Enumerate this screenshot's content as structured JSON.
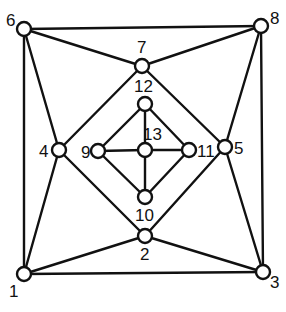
{
  "diagram": {
    "type": "graph",
    "node_radius": 7,
    "colors": {
      "stroke": "#111111",
      "node_fill": "#ffffff",
      "background": "#ffffff"
    },
    "nodes": [
      {
        "id": "1",
        "label": "1",
        "x": 24,
        "y": 274,
        "lx": 9,
        "ly": 297
      },
      {
        "id": "2",
        "label": "2",
        "x": 145,
        "y": 236,
        "lx": 140,
        "ly": 260
      },
      {
        "id": "3",
        "label": "3",
        "x": 263,
        "y": 272,
        "lx": 270,
        "ly": 288
      },
      {
        "id": "4",
        "label": "4",
        "x": 59,
        "y": 150,
        "lx": 39,
        "ly": 157
      },
      {
        "id": "5",
        "label": "5",
        "x": 225,
        "y": 147,
        "lx": 234,
        "ly": 154
      },
      {
        "id": "6",
        "label": "6",
        "x": 24,
        "y": 29,
        "lx": 6,
        "ly": 26
      },
      {
        "id": "7",
        "label": "7",
        "x": 142,
        "y": 66,
        "lx": 137,
        "ly": 53
      },
      {
        "id": "8",
        "label": "8",
        "x": 261,
        "y": 26,
        "lx": 270,
        "ly": 24
      },
      {
        "id": "9",
        "label": "9",
        "x": 98,
        "y": 151,
        "lx": 81,
        "ly": 158
      },
      {
        "id": "10",
        "label": "10",
        "x": 145,
        "y": 197,
        "lx": 135,
        "ly": 221
      },
      {
        "id": "11",
        "label": "11",
        "x": 189,
        "y": 150,
        "lx": 197,
        "ly": 157
      },
      {
        "id": "12",
        "label": "12",
        "x": 145,
        "y": 104,
        "lx": 134,
        "ly": 92
      },
      {
        "id": "13",
        "label": "13",
        "x": 145,
        "y": 150,
        "lx": 143,
        "ly": 140
      }
    ],
    "edges": [
      [
        "6",
        "8"
      ],
      [
        "8",
        "3"
      ],
      [
        "3",
        "1"
      ],
      [
        "1",
        "6"
      ],
      [
        "6",
        "7"
      ],
      [
        "6",
        "4"
      ],
      [
        "8",
        "7"
      ],
      [
        "8",
        "5"
      ],
      [
        "1",
        "4"
      ],
      [
        "1",
        "2"
      ],
      [
        "3",
        "2"
      ],
      [
        "3",
        "5"
      ],
      [
        "7",
        "4"
      ],
      [
        "7",
        "5"
      ],
      [
        "4",
        "2"
      ],
      [
        "5",
        "2"
      ],
      [
        "12",
        "9"
      ],
      [
        "12",
        "11"
      ],
      [
        "9",
        "10"
      ],
      [
        "11",
        "10"
      ],
      [
        "12",
        "13"
      ],
      [
        "13",
        "10"
      ],
      [
        "9",
        "13"
      ],
      [
        "13",
        "11"
      ]
    ]
  }
}
